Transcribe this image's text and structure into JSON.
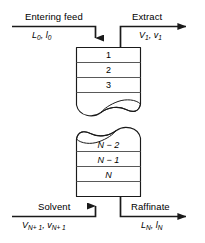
{
  "diagram": {
    "colors": {
      "line": "#1a1a1a",
      "divider": "#595959",
      "background": "#ffffff",
      "text": "#000000"
    },
    "streams": {
      "entering_feed": {
        "name": "Entering feed",
        "vars_main": "L",
        "vars_main_sub": "0",
        "vars_sep": ", ",
        "vars_second": "l",
        "vars_second_sub": "0",
        "direction": "in-top-left"
      },
      "extract": {
        "name": "Extract",
        "vars_main": "V",
        "vars_main_sub": "1",
        "vars_sep": ", ",
        "vars_second": "v",
        "vars_second_sub": "1",
        "direction": "out-top-right"
      },
      "solvent": {
        "name": "Solvent",
        "vars_main": "V",
        "vars_main_sub": "N+ 1",
        "vars_sep": ", ",
        "vars_second": "v",
        "vars_second_sub": "N+ 1",
        "direction": "in-bottom-left"
      },
      "raffinate": {
        "name": "Raffinate",
        "vars_main": "L",
        "vars_main_sub": "N",
        "vars_sep": ", ",
        "vars_second": "l",
        "vars_second_sub": "N",
        "direction": "out-bottom-right"
      }
    },
    "stages_top": [
      {
        "label": "1",
        "italic": false
      },
      {
        "label": "2",
        "italic": false
      },
      {
        "label": "3",
        "italic": false
      }
    ],
    "stages_bottom": [
      {
        "label": "N − 2",
        "italic": true
      },
      {
        "label": "N − 1",
        "italic": true
      },
      {
        "label": "N",
        "italic": true
      }
    ],
    "break_note": "torn-page break between stage 3 and stage N-2"
  }
}
